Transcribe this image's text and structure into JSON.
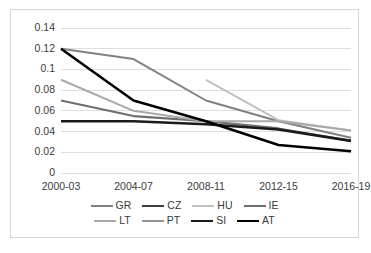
{
  "chart_data": {
    "type": "line",
    "title": "",
    "xlabel": "",
    "ylabel": "",
    "categories": [
      "2000-03",
      "2004-07",
      "2008-11",
      "2012-15",
      "2016-19"
    ],
    "yticks": [
      "0",
      "0.02",
      "0.04",
      "0.06",
      "0.08",
      "0.1",
      "0.12",
      "0.14"
    ],
    "ylim": [
      0,
      0.14
    ],
    "grid": "horizontal",
    "legend_position": "bottom",
    "series": [
      {
        "name": "GR",
        "color": "#808080",
        "width": 2.0,
        "values": [
          0.12,
          0.11,
          0.07,
          0.05,
          0.034
        ]
      },
      {
        "name": "CZ",
        "color": "#3f3f3f",
        "width": 2.4,
        "values": [
          null,
          null,
          null,
          null,
          null
        ]
      },
      {
        "name": "HU",
        "color": "#c0c0c0",
        "width": 2.0,
        "values": [
          null,
          null,
          0.09,
          0.051,
          0.041
        ]
      },
      {
        "name": "IE",
        "color": "#6e6e6e",
        "width": 2.2,
        "values": [
          0.07,
          0.055,
          0.05,
          0.043,
          0.031
        ]
      },
      {
        "name": "LT",
        "color": "#a9a9a9",
        "width": 2.0,
        "values": [
          0.09,
          0.06,
          0.05,
          0.05,
          0.041
        ]
      },
      {
        "name": "PT",
        "color": "#949494",
        "width": 2.0,
        "values": [
          null,
          null,
          null,
          null,
          null
        ]
      },
      {
        "name": "SI",
        "color": "#1a1a1a",
        "width": 2.6,
        "values": [
          0.05,
          0.05,
          0.047,
          0.042,
          0.031
        ]
      },
      {
        "name": "AT",
        "color": "#000000",
        "width": 2.6,
        "values": [
          0.12,
          0.07,
          0.05,
          0.027,
          0.021
        ]
      }
    ]
  },
  "legend": {
    "rows": [
      [
        "GR",
        "CZ",
        "HU",
        "IE"
      ],
      [
        "LT",
        "PT",
        "SI",
        "AT"
      ]
    ]
  },
  "colors": {
    "frame": "#d6d6d6",
    "gridline": "#dedede",
    "text": "#3a3a3a",
    "background": "#ffffff"
  }
}
